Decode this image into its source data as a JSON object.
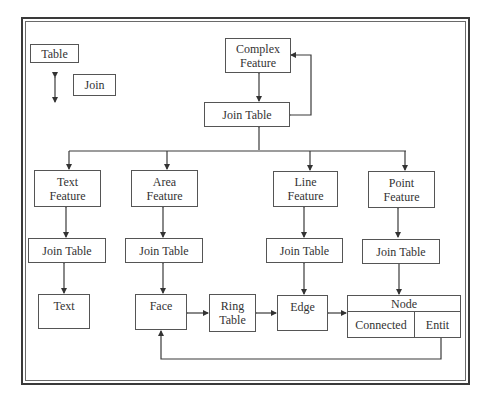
{
  "legend": {
    "table_label": "Table",
    "join_label": "Join"
  },
  "nodes": {
    "complex_feature": [
      "Complex",
      "Feature"
    ],
    "join_table_top": "Join Table",
    "text_feature": [
      "Text",
      "Feature"
    ],
    "area_feature": [
      "Area",
      "Feature"
    ],
    "line_feature": [
      "Line",
      "Feature"
    ],
    "point_feature": [
      "Point",
      "Feature"
    ],
    "join_table_text": "Join Table",
    "join_table_area": "Join Table",
    "join_table_line": "Join Table",
    "join_table_point": "Join Table",
    "text": "Text",
    "face": "Face",
    "ring_table": [
      "Ring",
      "Table"
    ],
    "edge": "Edge",
    "node": {
      "header": "Node",
      "cells": [
        "Connected",
        "Entit"
      ]
    }
  },
  "colors": {
    "line": "#3a3a3a",
    "box_border": "#555555",
    "background": "#ffffff"
  }
}
